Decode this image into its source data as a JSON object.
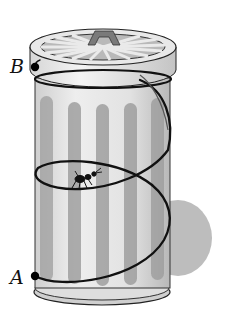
{
  "diagram": {
    "points": [
      {
        "id": "B",
        "label": "B",
        "position": "top-left of can body, below lid"
      },
      {
        "id": "A",
        "label": "A",
        "position": "bottom-left of can body"
      }
    ],
    "objects": [
      "cylinder-trash-can",
      "lid-with-radial-pattern",
      "helix-path",
      "ant",
      "shadow"
    ],
    "colors": {
      "stripe": "#9a9a9a",
      "body": "#dcdcdc",
      "path": "#111111",
      "shadow": "#bdbdbd",
      "lid_top": "#c8c8c8"
    }
  }
}
